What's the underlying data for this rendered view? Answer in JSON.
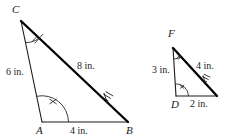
{
  "figure": {
    "stroke_color": "#1a1a1a",
    "thick_stroke_color": "#000000",
    "background": "#ffffff"
  },
  "triangle_large": {
    "name": "triangle-abc",
    "vertices": [
      {
        "id": "C",
        "label": "C",
        "x": 21,
        "y": 21
      },
      {
        "id": "A",
        "label": "A",
        "x": 42,
        "y": 122
      },
      {
        "id": "B",
        "label": "B",
        "x": 128,
        "y": 122
      }
    ],
    "vertex_labels": {
      "C": {
        "text": "C",
        "x": 12,
        "y": 4
      },
      "A": {
        "text": "A",
        "x": 36,
        "y": 125
      },
      "B": {
        "text": "B",
        "x": 126,
        "y": 125
      }
    },
    "sides": [
      {
        "id": "CA",
        "label": "6 in.",
        "from": "C",
        "to": "A",
        "label_x": 6,
        "label_y": 67,
        "weight": "thin"
      },
      {
        "id": "CB",
        "label": "8 in.",
        "from": "C",
        "to": "B",
        "label_x": 77,
        "label_y": 61,
        "weight": "thick",
        "ticks": 3
      },
      {
        "id": "AB",
        "label": "4 in.",
        "from": "A",
        "to": "B",
        "label_x": 70,
        "label_y": 126,
        "weight": "thin"
      }
    ],
    "angle_marks": [
      {
        "at": "C",
        "ticks": 2
      },
      {
        "at": "A",
        "ticks": 1
      }
    ]
  },
  "triangle_small": {
    "name": "triangle-def",
    "vertices": [
      {
        "id": "F",
        "label": "F",
        "x": 173,
        "y": 48
      },
      {
        "id": "D",
        "label": "D",
        "x": 176,
        "y": 96
      },
      {
        "id": "E",
        "label": "E",
        "x": 217,
        "y": 96
      }
    ],
    "vertex_labels": {
      "F": {
        "text": "F",
        "x": 168,
        "y": 28
      },
      "D": {
        "text": "D",
        "x": 171,
        "y": 99
      }
    },
    "sides": [
      {
        "id": "FD",
        "label": "3 in.",
        "from": "F",
        "to": "D",
        "label_x": 152,
        "label_y": 65,
        "weight": "thin"
      },
      {
        "id": "FE",
        "label": "4 in.",
        "from": "F",
        "to": "E",
        "label_x": 196,
        "label_y": 61,
        "weight": "thick",
        "ticks": 3
      },
      {
        "id": "DE",
        "label": "2 in.",
        "from": "D",
        "to": "E",
        "label_x": 190,
        "label_y": 99,
        "weight": "thin"
      }
    ],
    "angle_marks": [
      {
        "at": "F",
        "ticks": 2
      },
      {
        "at": "D",
        "ticks": 1
      }
    ]
  }
}
